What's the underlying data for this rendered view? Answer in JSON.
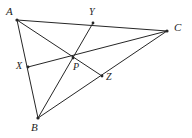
{
  "figure": {
    "background_color": "#ffffff",
    "stroke_color": "#262626",
    "label_color": "#1d1d1d",
    "stroke_width": 1,
    "width": 192,
    "height": 138
  },
  "points": {
    "A": {
      "label": "A",
      "x": 17,
      "y": 20,
      "label_x": 6,
      "label_y": 6,
      "size": "major"
    },
    "B": {
      "label": "B",
      "x": 38,
      "y": 118,
      "label_x": 31,
      "label_y": 122,
      "size": "major"
    },
    "C": {
      "label": "C",
      "x": 167,
      "y": 31,
      "label_x": 174,
      "label_y": 22,
      "size": "major"
    },
    "P": {
      "label": "P",
      "x": 73,
      "y": 58,
      "label_x": 73,
      "label_y": 62,
      "size": "minor"
    },
    "X": {
      "label": "X",
      "x": 28,
      "y": 67,
      "label_x": 16,
      "label_y": 61,
      "size": "minor"
    },
    "Y": {
      "label": "Y",
      "x": 93,
      "y": 23,
      "label_x": 89,
      "label_y": 7,
      "size": "minor"
    },
    "Z": {
      "label": "Z",
      "x": 102,
      "y": 76,
      "label_x": 106,
      "label_y": 72,
      "size": "minor"
    }
  },
  "segments": [
    {
      "name": "side-ab",
      "from": "A",
      "to": "B"
    },
    {
      "name": "side-bc",
      "from": "B",
      "to": "C"
    },
    {
      "name": "side-ca",
      "from": "C",
      "to": "A"
    },
    {
      "name": "cevian-az",
      "from": "A",
      "to": "Z"
    },
    {
      "name": "cevian-by",
      "from": "B",
      "to": "Y"
    },
    {
      "name": "cevian-cx",
      "from": "C",
      "to": "X"
    }
  ]
}
